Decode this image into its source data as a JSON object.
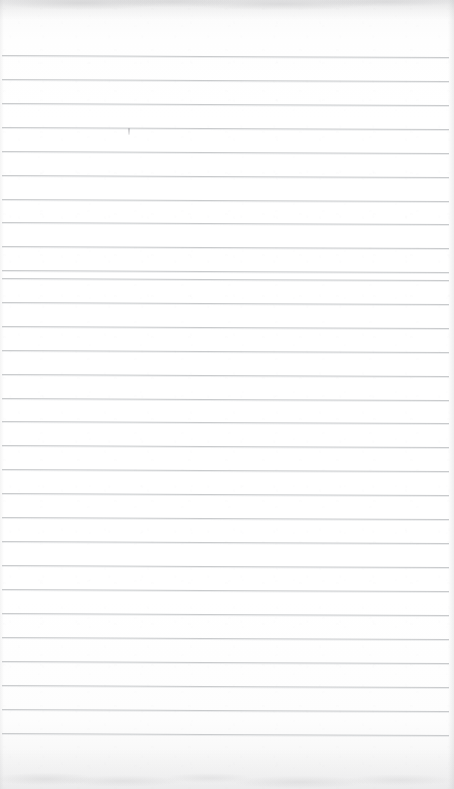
{
  "page": {
    "kind": "scanned-ruled-notebook-page",
    "width": 454,
    "height": 789,
    "paper_color": "#fdfdfd",
    "rule_color": "#c9cbcd",
    "edge_shadow_color": "#96969a",
    "content_text": "",
    "has_handwriting": false,
    "has_printed_text": false
  },
  "ruling": {
    "line_count": 29,
    "spacing_px": 24,
    "first_line_y": 55,
    "last_line_y": 733,
    "line_left_x": 2,
    "line_right_x": 449,
    "skew_degrees": 0.26,
    "line_thickness_px": 1,
    "lines": [
      {
        "index": 1,
        "y": 55
      },
      {
        "index": 2,
        "y": 79
      },
      {
        "index": 3,
        "y": 103
      },
      {
        "index": 4,
        "y": 127
      },
      {
        "index": 5,
        "y": 151
      },
      {
        "index": 6,
        "y": 175
      },
      {
        "index": 7,
        "y": 199
      },
      {
        "index": 8,
        "y": 222
      },
      {
        "index": 9,
        "y": 246
      },
      {
        "index": 10,
        "y": 270
      },
      {
        "index": 11,
        "y": 278
      },
      {
        "index": 12,
        "y": 302
      },
      {
        "index": 13,
        "y": 326
      },
      {
        "index": 14,
        "y": 350
      },
      {
        "index": 15,
        "y": 374
      },
      {
        "index": 16,
        "y": 398
      },
      {
        "index": 17,
        "y": 421
      },
      {
        "index": 18,
        "y": 445
      },
      {
        "index": 19,
        "y": 469
      },
      {
        "index": 20,
        "y": 493
      },
      {
        "index": 21,
        "y": 517
      },
      {
        "index": 22,
        "y": 541
      },
      {
        "index": 23,
        "y": 565
      },
      {
        "index": 24,
        "y": 589
      },
      {
        "index": 25,
        "y": 613
      },
      {
        "index": 26,
        "y": 637
      },
      {
        "index": 27,
        "y": 661
      },
      {
        "index": 28,
        "y": 685
      },
      {
        "index": 29,
        "y": 709
      },
      {
        "index": 30,
        "y": 733
      }
    ]
  },
  "marks": [
    {
      "name": "faint-pencil-mark",
      "x": 128,
      "y": 128,
      "width": 2,
      "height": 7
    }
  ],
  "margins": {
    "top_blank_px": 55,
    "bottom_blank_px": 56,
    "has_vertical_margin_rule": false
  }
}
